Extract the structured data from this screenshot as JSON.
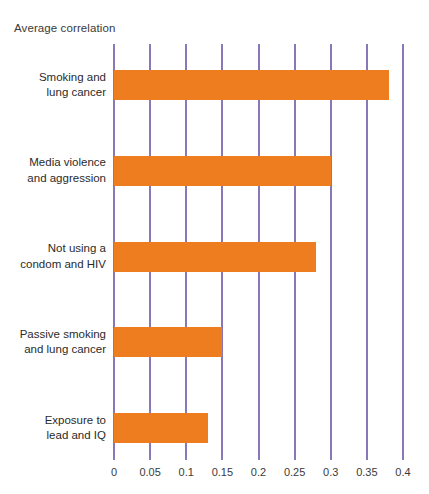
{
  "chart_data": {
    "type": "bar",
    "orientation": "horizontal",
    "title": "",
    "xlabel": "",
    "ylabel": "",
    "axis_title": "Average correlation",
    "categories": [
      "Smoking and\nlung cancer",
      "Media violence\nand aggression",
      "Not using a\ncondom and HIV",
      "Passive smoking\nand lung cancer",
      "Exposure to\nlead and IQ"
    ],
    "category_lines": [
      [
        "Smoking and",
        "lung cancer"
      ],
      [
        "Media violence",
        "and aggression"
      ],
      [
        "Not using a",
        "condom and HIV"
      ],
      [
        "Passive smoking",
        "and lung cancer"
      ],
      [
        "Exposure to",
        "lead and IQ"
      ]
    ],
    "values": [
      0.38,
      0.3,
      0.28,
      0.15,
      0.13
    ],
    "xlim": [
      0,
      0.4
    ],
    "xticks": [
      0,
      0.05,
      0.1,
      0.15,
      0.2,
      0.25,
      0.3,
      0.35,
      0.4
    ],
    "xtick_labels": [
      "0",
      "0.05",
      "0.1",
      "0.15",
      "0.2",
      "0.25",
      "0.3",
      "0.35",
      "0.4"
    ],
    "grid": true,
    "legend": null,
    "colors": {
      "bar": "#ed7d1f",
      "gridline": "#8878b8",
      "text": "#2b2b2b",
      "background": "#ffffff"
    }
  }
}
